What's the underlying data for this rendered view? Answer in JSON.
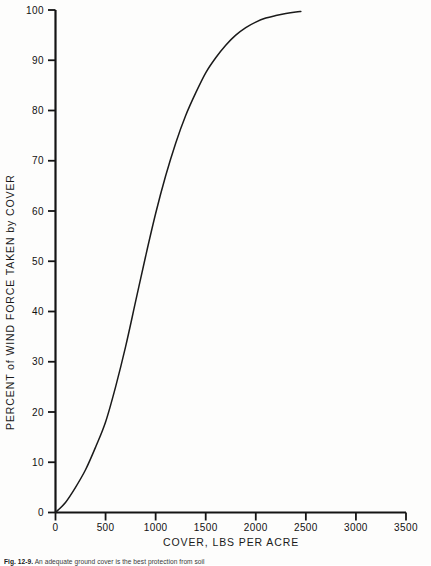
{
  "chart_data": {
    "type": "line",
    "title": "",
    "xlabel": "COVER, LBS PER ACRE",
    "ylabel": "PERCENT of WIND FORCE TAKEN by COVER",
    "xlim": [
      0,
      3500
    ],
    "ylim": [
      0,
      100
    ],
    "xticks": [
      0,
      500,
      1000,
      1500,
      2000,
      2500,
      3000,
      3500
    ],
    "yticks": [
      0,
      10,
      20,
      30,
      40,
      50,
      60,
      70,
      80,
      90,
      100
    ],
    "xtick_labels": [
      "0",
      "500",
      "1000",
      "1500",
      "2000",
      "2500",
      "3000",
      "3500"
    ],
    "ytick_labels": [
      "0",
      "10",
      "20",
      "30",
      "40",
      "50",
      "60",
      "70",
      "80",
      "90",
      "100"
    ],
    "grid": false,
    "legend": false,
    "legend_position": "none",
    "line_color": "#1a1a1a",
    "series": [
      {
        "name": "Wind force taken by cover",
        "x": [
          0,
          100,
          200,
          300,
          400,
          500,
          600,
          700,
          800,
          900,
          1000,
          1100,
          1200,
          1300,
          1400,
          1500,
          1600,
          1700,
          1800,
          1900,
          2000,
          2100,
          2200,
          2300,
          2400,
          2450
        ],
        "values": [
          0,
          2,
          5,
          8.5,
          13,
          18,
          25,
          33,
          42,
          51,
          59.5,
          67,
          73.5,
          79,
          83.5,
          87.5,
          90.5,
          93,
          95,
          96.5,
          97.6,
          98.4,
          98.9,
          99.3,
          99.6,
          99.7
        ]
      }
    ]
  },
  "axes": {
    "x_title": "COVER, LBS PER ACRE",
    "y_title": "PERCENT of WIND FORCE TAKEN by COVER"
  },
  "caption": {
    "figure_number": "Fig. 12-9.",
    "text": "An adequate ground cover is the best protection from soil"
  }
}
